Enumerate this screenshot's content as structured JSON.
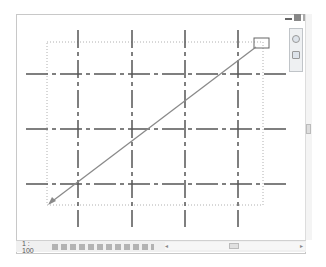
{
  "window": {
    "controls": [
      "minimize",
      "restore",
      "close"
    ]
  },
  "status_bar": {
    "scale": "1 : 100",
    "icons": [
      "detail-level-icon",
      "visual-style-icon",
      "sun-path-icon",
      "shadows-icon",
      "render-icon",
      "crop-view-icon",
      "show-crop-icon",
      "temporary-hide-icon",
      "reveal-hidden-icon",
      "temporary-view-properties-icon",
      "analytical-model-icon",
      "more-icon"
    ]
  },
  "navigation_bar": {
    "items": [
      "steering-wheel-icon",
      "zoom-icon"
    ]
  },
  "drawing": {
    "horizontal_grids_y": [
      74,
      129,
      184
    ],
    "vertical_grids_x": [
      78,
      132,
      185,
      238
    ],
    "crop_region": {
      "x1": 47,
      "y1": 42,
      "x2": 263,
      "y2": 205
    },
    "arrow": {
      "from": [
        258,
        47
      ],
      "to": [
        49,
        203
      ]
    },
    "selection_box": {
      "x": 254,
      "y": 38,
      "w": 15,
      "h": 10
    },
    "grid_color": "#555555",
    "arrow_color": "#8a8a8a"
  }
}
